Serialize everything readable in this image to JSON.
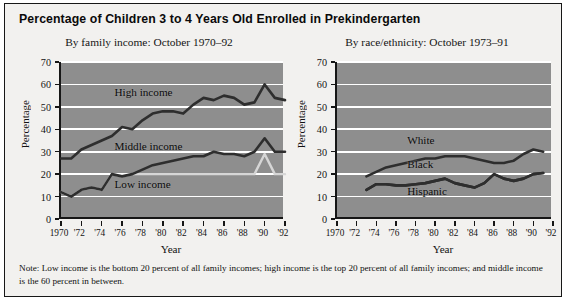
{
  "figure": {
    "title": "Percentage of Children 3 to 4 Years Old Enrolled in Prekindergarten",
    "note": "Note: Low income is the bottom 20 percent of all family incomes; high income is the top 20 percent of all family incomes; and middle income is the 60 percent in between.",
    "background": "#f2f1ef",
    "plot_background": "#8e8e8e",
    "border_color": "#171717",
    "gridline_color": "#ffffff"
  },
  "chart_data": [
    {
      "type": "line",
      "id": "by-family-income",
      "title": "By family income: October 1970–92",
      "xlabel": "Year",
      "ylabel": "Percentage",
      "ylim": [
        0,
        70
      ],
      "yticks": [
        0,
        10,
        20,
        30,
        40,
        50,
        60,
        70
      ],
      "xlim": [
        1970,
        1992
      ],
      "xticks": [
        1970,
        1972,
        1974,
        1976,
        1978,
        1980,
        1982,
        1984,
        1986,
        1988,
        1990,
        1992
      ],
      "xticklabels": [
        "1970",
        "'72",
        "'74",
        "'76",
        "'78",
        "'80",
        "'82",
        "'84",
        "'86",
        "'88",
        "'90",
        "'92"
      ],
      "grid": "horizontal",
      "legend": "inline-annotations",
      "x": [
        1970,
        1971,
        1972,
        1973,
        1974,
        1975,
        1976,
        1977,
        1978,
        1979,
        1980,
        1981,
        1982,
        1983,
        1984,
        1985,
        1986,
        1987,
        1988,
        1989,
        1990,
        1991,
        1992
      ],
      "series": [
        {
          "name": "High income",
          "color": "#2e2e2e",
          "label_x": 1978,
          "label_y": 56,
          "values": [
            27,
            27,
            31,
            33,
            35,
            37,
            41,
            40,
            44,
            47,
            48,
            48,
            47,
            51,
            54,
            53,
            55,
            54,
            51,
            52,
            60,
            54,
            53
          ]
        },
        {
          "name": "Middle income",
          "color": "#2e2e2e",
          "label_x": 1978,
          "label_y": 32,
          "values": [
            12,
            10,
            13,
            14,
            13,
            20,
            19,
            20,
            22,
            24,
            25,
            26,
            27,
            28,
            28,
            30,
            29,
            29,
            28,
            30,
            36,
            30,
            30
          ]
        },
        {
          "name": "Low income",
          "color": "#d6d6d6",
          "label_x": 1978,
          "label_y": 15,
          "values": [
            12,
            10,
            13,
            14,
            13,
            20,
            19,
            20,
            20,
            20,
            20,
            20,
            20,
            20,
            20,
            20,
            20,
            20,
            20,
            20,
            29,
            20,
            20
          ]
        }
      ]
    },
    {
      "type": "line",
      "id": "by-race-ethnicity",
      "title": "By race/ethnicity: October 1973–91",
      "xlabel": "Year",
      "ylabel": "Percentage",
      "ylim": [
        0,
        70
      ],
      "yticks": [
        0,
        10,
        20,
        30,
        40,
        50,
        60,
        70
      ],
      "xlim": [
        1970,
        1992
      ],
      "xticks": [
        1970,
        1972,
        1974,
        1976,
        1978,
        1980,
        1982,
        1984,
        1986,
        1988,
        1990,
        1992
      ],
      "xticklabels": [
        "1970",
        "'72",
        "'74",
        "'76",
        "'78",
        "'80",
        "'82",
        "'84",
        "'86",
        "'88",
        "'90",
        "'92"
      ],
      "grid": "horizontal",
      "legend": "inline-annotations",
      "x": [
        1973,
        1974,
        1975,
        1976,
        1977,
        1978,
        1979,
        1980,
        1981,
        1982,
        1983,
        1984,
        1985,
        1986,
        1987,
        1988,
        1989,
        1990,
        1991
      ],
      "series": [
        {
          "name": "White",
          "color": "#2e2e2e",
          "label_x": 1980,
          "label_y": 35,
          "values": [
            19,
            21,
            23,
            24,
            25,
            26,
            27,
            27,
            28,
            28,
            28,
            27,
            26,
            25,
            25,
            26,
            29,
            31,
            30
          ]
        },
        {
          "name": "Black",
          "color": "#2e2e2e",
          "label_x": 1980,
          "label_y": 24,
          "values": [
            13,
            15.5,
            15.5,
            15,
            15,
            15.5,
            16,
            17,
            18,
            16,
            15,
            14,
            16,
            20,
            18,
            17,
            18,
            20,
            20.5
          ]
        },
        {
          "name": "Hispanic",
          "color": "#2e2e2e",
          "label_x": 1980,
          "label_y": 12,
          "values": [
            13,
            15.5,
            15.5,
            15,
            15,
            15.5,
            16,
            17,
            18,
            16,
            15,
            14,
            16,
            20,
            18,
            17,
            18,
            20,
            20.5
          ]
        }
      ]
    }
  ]
}
